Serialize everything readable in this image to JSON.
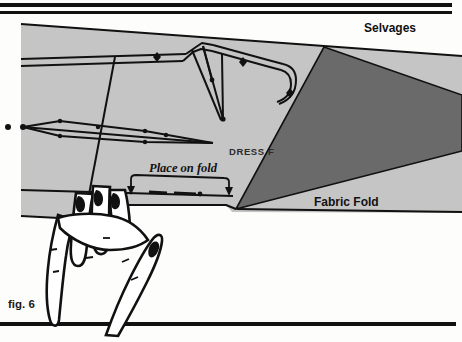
{
  "figure": {
    "caption": "fig. 6",
    "background_color": "#fdfdfb",
    "ink_color": "#111111"
  },
  "rules": {
    "top_rule_1_color": "#111111",
    "top_rule_2_color": "#111111",
    "bottom_rule_color": "#111111"
  },
  "fabric": {
    "light_fill": "#c5c5c5",
    "light_edge": "#111111",
    "fold_triangle_fill": "#6a6a6a",
    "labels": {
      "selvages": "Selvages",
      "fabric_fold": "Fabric Fold"
    }
  },
  "pattern_piece": {
    "name_label": "DRESS F",
    "name_label_full_reading": "DRESS F",
    "fold_instruction": "Place on fold",
    "line_color": "#111111",
    "notch_color": "#111111"
  },
  "hand": {
    "outline_color": "#111111",
    "fill_color": "#ffffff",
    "finger_count": 5,
    "description": "hand holding pattern down"
  }
}
